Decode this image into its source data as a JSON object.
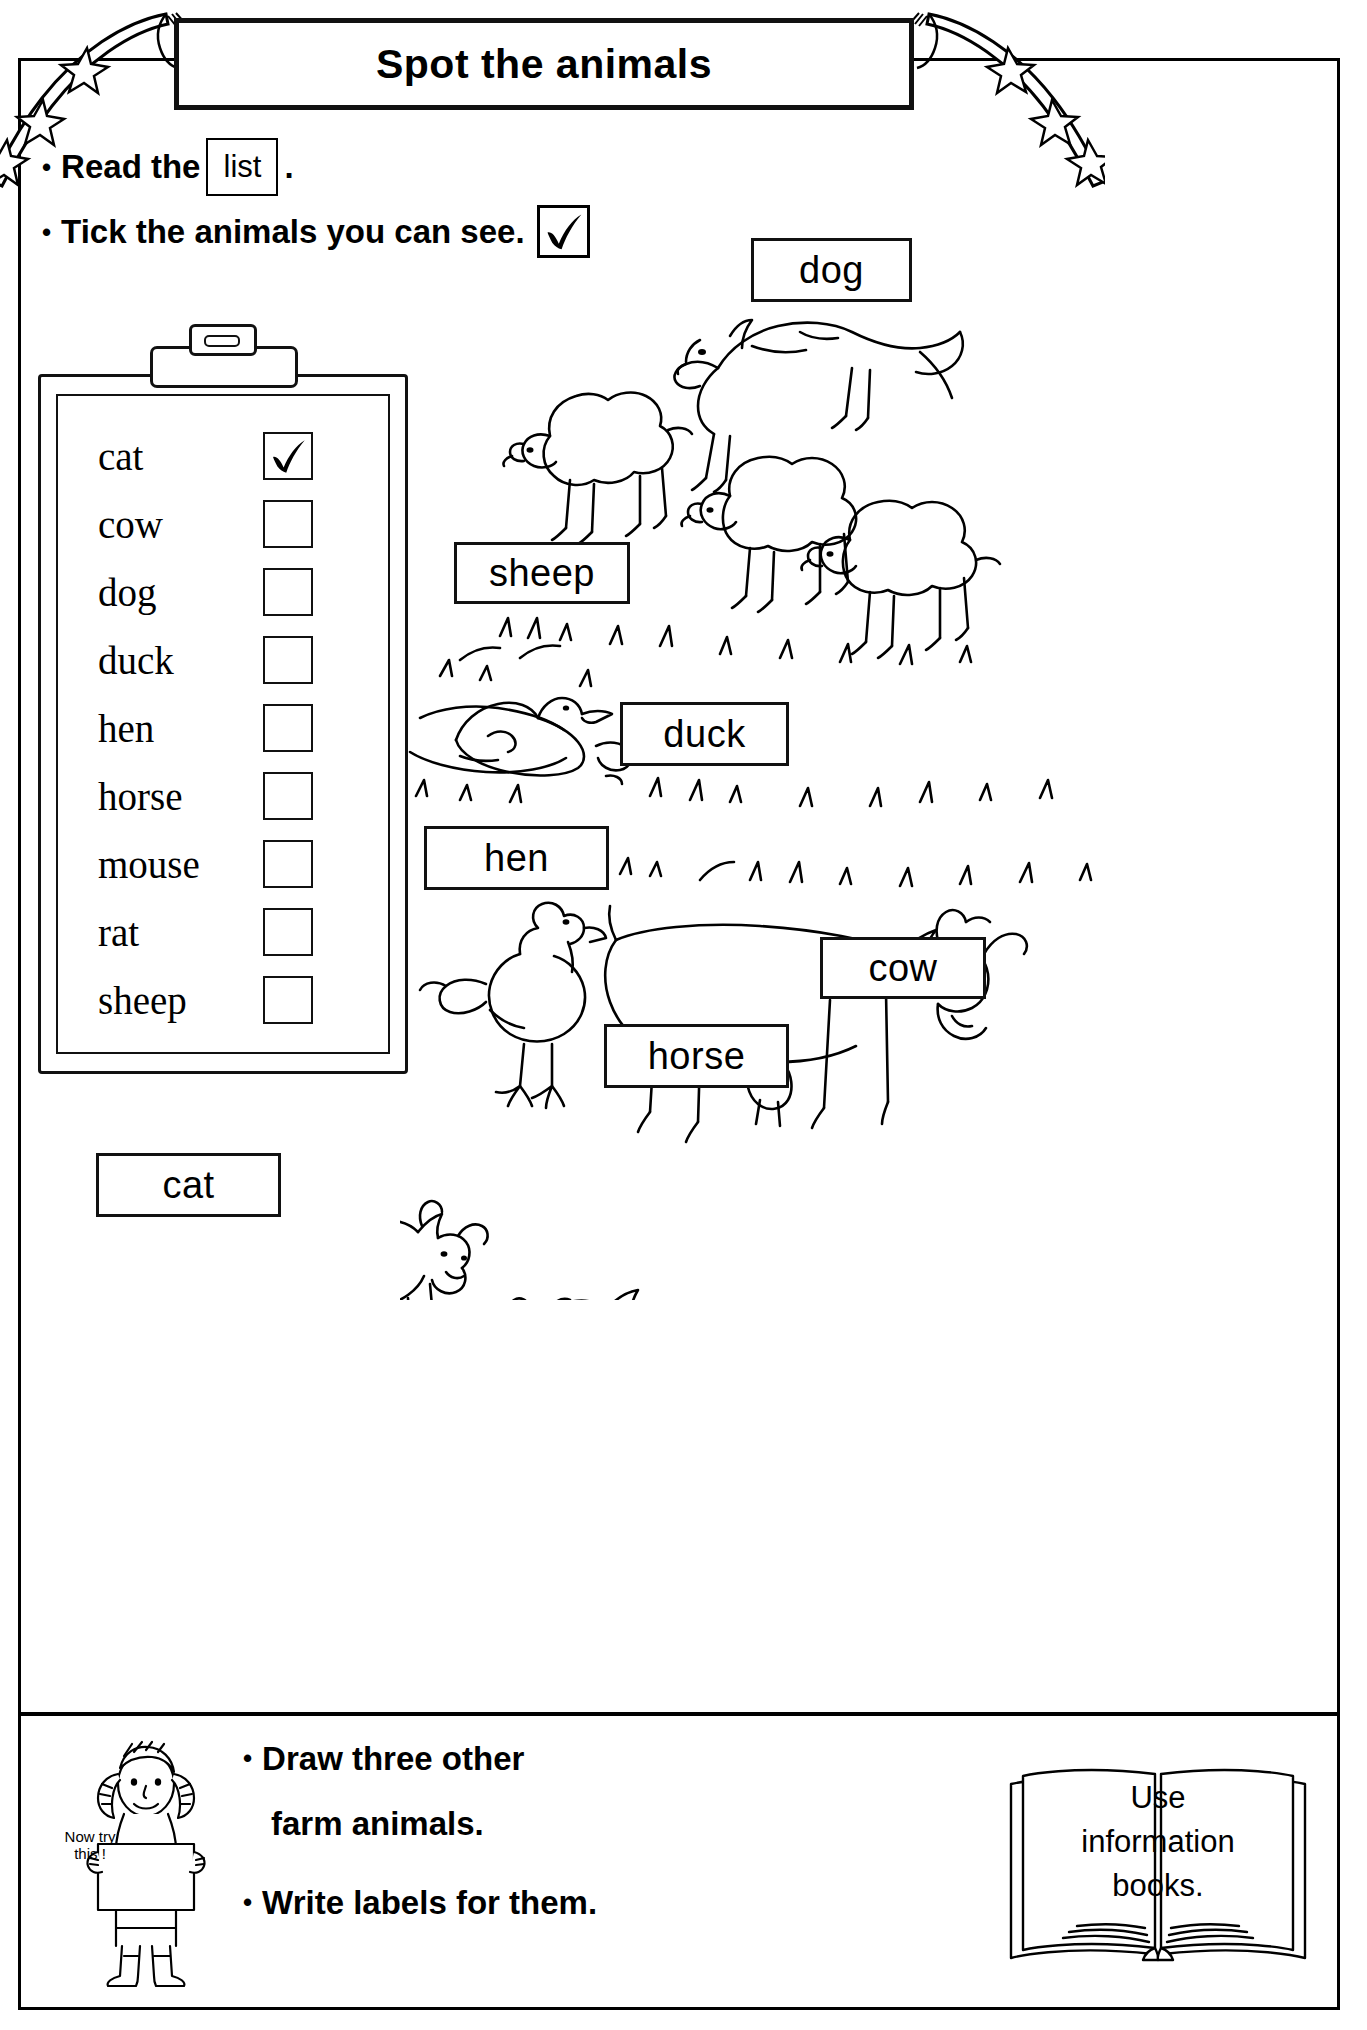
{
  "title": "Spot the animals",
  "instructions": [
    {
      "bullet": "•",
      "before": "Read the",
      "chip": "list",
      "after": ".",
      "has_tick": false
    },
    {
      "bullet": "•",
      "before": "Tick the animals you can see.",
      "chip": "",
      "after": "",
      "has_tick": true
    }
  ],
  "clipboard": {
    "items": [
      {
        "word": "cat",
        "checked": true
      },
      {
        "word": "cow",
        "checked": false
      },
      {
        "word": "dog",
        "checked": false
      },
      {
        "word": "duck",
        "checked": false
      },
      {
        "word": "hen",
        "checked": false
      },
      {
        "word": "horse",
        "checked": false
      },
      {
        "word": "mouse",
        "checked": false
      },
      {
        "word": "rat",
        "checked": false
      },
      {
        "word": "sheep",
        "checked": false
      }
    ]
  },
  "picture_labels": [
    {
      "text": "dog",
      "left": 751,
      "top": 238,
      "width": 161,
      "height": 64
    },
    {
      "text": "sheep",
      "left": 454,
      "top": 542,
      "width": 176,
      "height": 62
    },
    {
      "text": "duck",
      "left": 620,
      "top": 702,
      "width": 169,
      "height": 64
    },
    {
      "text": "hen",
      "left": 424,
      "top": 826,
      "width": 185,
      "height": 64
    },
    {
      "text": "cow",
      "left": 820,
      "top": 937,
      "width": 166,
      "height": 62
    },
    {
      "text": "horse",
      "left": 604,
      "top": 1024,
      "width": 185,
      "height": 64
    },
    {
      "text": "cat",
      "left": 96,
      "top": 1153,
      "width": 185,
      "height": 64
    }
  ],
  "footer": {
    "lines": [
      {
        "bullet": "•",
        "text": "Draw three other"
      },
      {
        "bullet": "",
        "text": "farm animals."
      },
      {
        "bullet": "•",
        "text": "Write labels for them."
      }
    ],
    "sign": {
      "line1": "Now try",
      "line2": "this !"
    },
    "book": {
      "line1": "Use",
      "line2": "information",
      "line3": "books."
    }
  },
  "icons": {
    "tick": "check-mark",
    "clipboard": "clipboard-icon",
    "girl": "girl-with-sign-icon",
    "book": "open-book-icon",
    "ribbon_left": "ribbon-banner-left-icon",
    "ribbon_right": "ribbon-banner-right-icon"
  },
  "colors": {
    "ink": "#000000",
    "paper": "#ffffff"
  }
}
